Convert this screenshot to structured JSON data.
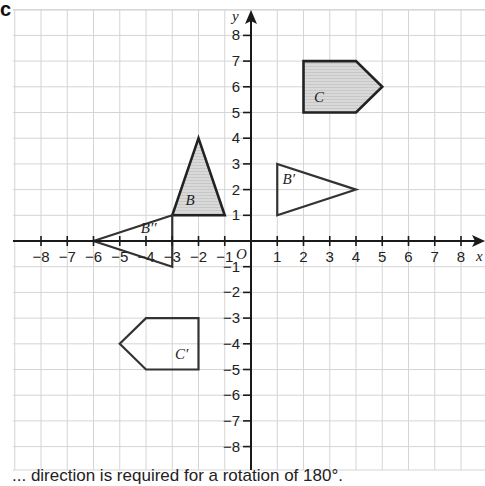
{
  "question_label": "c",
  "caption": "... direction is required for a rotation of 180°.",
  "colors": {
    "grid": "#d4d4d4",
    "axis": "#1a1a1a",
    "shape_stroke": "#222222",
    "shape_outline_light": "#333333",
    "shaded_fill": "#d9d9d9"
  },
  "axes": {
    "x_label": "x",
    "y_label": "y",
    "origin_label": "O",
    "x_ticks": [
      "-8",
      "-7",
      "-6",
      "-5",
      "-4",
      "-3",
      "-2",
      "-1",
      "1",
      "2",
      "3",
      "4",
      "5",
      "6",
      "7",
      "8"
    ],
    "y_ticks": [
      "8",
      "7",
      "6",
      "5",
      "4",
      "3",
      "2",
      "1",
      "-1",
      "-2",
      "-3",
      "-4",
      "-5",
      "-6",
      "-7",
      "-8"
    ],
    "range": {
      "x": [
        -8,
        8
      ],
      "y": [
        -8,
        8
      ]
    }
  },
  "shapes": [
    {
      "name": "B",
      "label": "B",
      "shaded": true,
      "vertices": [
        [
          -3,
          1
        ],
        [
          -2,
          4
        ],
        [
          -1,
          1
        ]
      ]
    },
    {
      "name": "B'",
      "label": "B′",
      "shaded": false,
      "vertices": [
        [
          1,
          1
        ],
        [
          1,
          3
        ],
        [
          4,
          2
        ]
      ]
    },
    {
      "name": "B''",
      "label": "B′′",
      "shaded": false,
      "vertices": [
        [
          -6,
          0
        ],
        [
          -3,
          1
        ],
        [
          -3,
          -1
        ]
      ]
    },
    {
      "name": "C",
      "label": "C",
      "shaded": true,
      "vertices": [
        [
          2,
          5
        ],
        [
          2,
          7
        ],
        [
          4,
          7
        ],
        [
          5,
          6
        ],
        [
          4,
          5
        ]
      ]
    },
    {
      "name": "C'",
      "label": "C′",
      "shaded": false,
      "vertices": [
        [
          -2,
          -3
        ],
        [
          -2,
          -5
        ],
        [
          -4,
          -5
        ],
        [
          -5,
          -4
        ],
        [
          -4,
          -3
        ]
      ]
    }
  ]
}
